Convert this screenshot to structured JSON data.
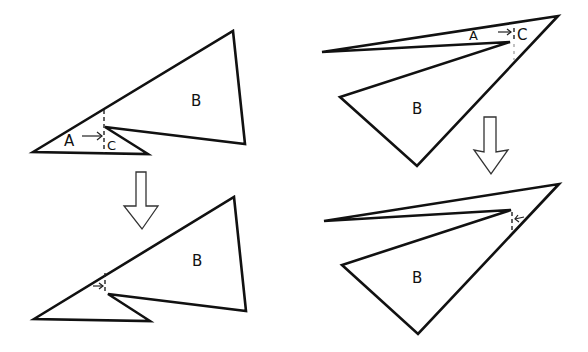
{
  "figure": {
    "panels": [
      {
        "id": "top-left",
        "stage": "before",
        "labels": {
          "a": "A",
          "b": "B",
          "c": "C"
        }
      },
      {
        "id": "bottom-left",
        "stage": "after",
        "labels": {
          "b": "B"
        }
      },
      {
        "id": "top-right",
        "stage": "before",
        "labels": {
          "a": "A",
          "b": "B",
          "c": "C"
        }
      },
      {
        "id": "bottom-right",
        "stage": "after",
        "labels": {
          "b": "B"
        }
      }
    ],
    "transition_arrows": [
      {
        "column": "left",
        "direction": "down",
        "icon": "hollow-double-line-down-arrow"
      },
      {
        "column": "right",
        "direction": "down",
        "icon": "hollow-double-line-down-arrow"
      }
    ],
    "colors": {
      "stroke": "#111111",
      "background": "#ffffff"
    }
  }
}
